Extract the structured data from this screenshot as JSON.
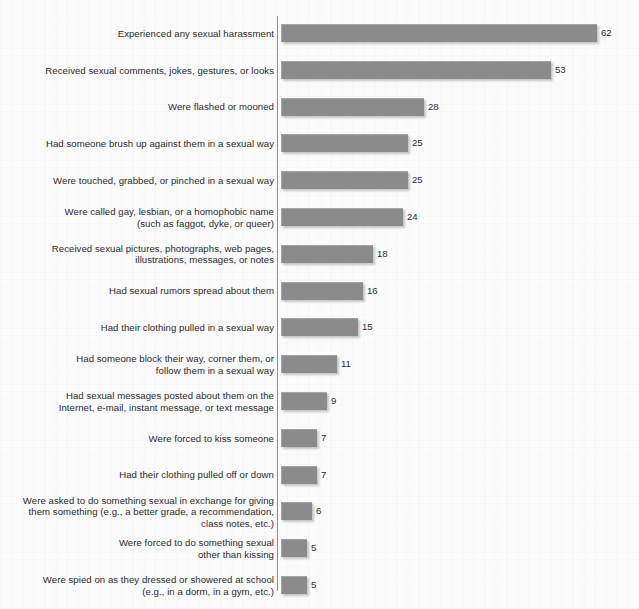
{
  "chart": {
    "background_color": "#fbfbfb",
    "bar_color": "#8b8b8b",
    "axis_color": "#8f8f8f",
    "text_color": "#2a2a2a"
  },
  "chart_data": {
    "type": "bar",
    "orientation": "horizontal",
    "title": "",
    "subtitle": "",
    "xlabel": "",
    "ylabel": "",
    "grid": false,
    "legend": false,
    "xlim": [
      0,
      62
    ],
    "value_suffix": "",
    "categories": [
      "Experienced any sexual harassment",
      "Received sexual comments, jokes, gestures, or looks",
      "Were flashed or mooned",
      "Had someone brush up against them in a sexual way",
      "Were touched, grabbed, or pinched in a sexual way",
      "Were called gay, lesbian, or a homophobic name\n(such as faggot, dyke, or queer)",
      "Received sexual pictures, photographs, web pages,\nillustrations, messages, or notes",
      "Had sexual rumors spread about them",
      "Had their clothing pulled in a sexual way",
      "Had someone block their way, corner them, or\nfollow them in a sexual way",
      "Had sexual messages posted about them on the\nInternet, e-mail, instant message, or text message",
      "Were forced to kiss someone",
      "Had their clothing pulled off or down",
      "Were asked to do something sexual in exchange for giving\nthem something (e.g., a better grade, a recommendation,\nclass notes, etc.)",
      "Were forced to do something sexual\nother than kissing",
      "Were spied on as they dressed or showered at school\n(e.g., in a dorm, in a gym, etc.)"
    ],
    "values": [
      62,
      53,
      28,
      25,
      25,
      24,
      18,
      16,
      15,
      11,
      9,
      7,
      7,
      6,
      5,
      5
    ],
    "value_labels": [
      "62",
      "53",
      "28",
      "25",
      "25",
      "24",
      "18",
      "16",
      "15",
      "11",
      "9",
      "7",
      "7",
      "6",
      "5",
      "5"
    ]
  },
  "layout": {
    "bar_origin_x": 281,
    "px_per_unit": 5.1,
    "first_row_center_y": 33,
    "row_pitch": 36.8,
    "bar_height": 18
  }
}
